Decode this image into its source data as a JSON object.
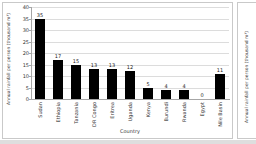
{
  "chart_data": {
    "type": "bar",
    "title": "",
    "categories": [
      "Sudan",
      "Ethiopia",
      "Tanzania",
      "DR Congo",
      "Eritrea",
      "Uganda",
      "Kenya",
      "Burundi",
      "Rwanda",
      "Egypt",
      "Nile Basin"
    ],
    "values": [
      35,
      17,
      15,
      13,
      13,
      12,
      5,
      4,
      4,
      0,
      11
    ],
    "data_labels": true,
    "xlabel": "Country",
    "ylabel": "Annual rainfall per person (thousand m³)",
    "ylim": [
      0,
      40
    ],
    "yticks": [
      0,
      5,
      10,
      15,
      20,
      25,
      30,
      35,
      40
    ],
    "grid": "horizontal",
    "legend": "none",
    "bar_color": "#000000",
    "gridline_color": "#dcdcdc",
    "axis_color": "#a6a6a6",
    "text_color": "#333333"
  },
  "right_chart_partial": {
    "ylabel": "Annual rainfall per person (thousand m³)"
  }
}
